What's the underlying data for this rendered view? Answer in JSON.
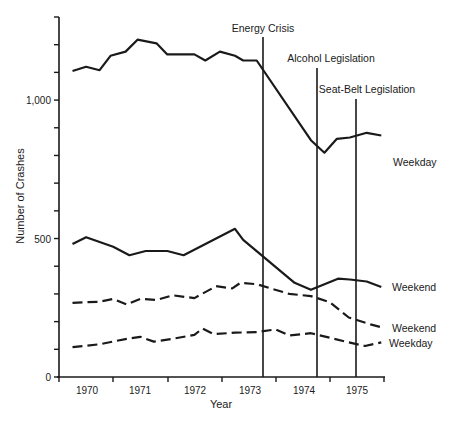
{
  "chart_data": {
    "type": "line",
    "title": "",
    "xlabel": "Year",
    "ylabel": "Number of Crashes",
    "ylim": [
      0,
      1300
    ],
    "yticks": [
      0,
      100,
      200,
      300,
      400,
      500,
      600,
      700,
      800,
      900,
      1000,
      1100,
      1200,
      1300
    ],
    "ytick_labels": [
      {
        "value": 0,
        "label": "0"
      },
      {
        "value": 500,
        "label": "500"
      },
      {
        "value": 1000,
        "label": "1,000"
      }
    ],
    "xlim": [
      1969.75,
      1975.75
    ],
    "xticks": [
      1969.75,
      1970.75,
      1971.75,
      1972.75,
      1973.75,
      1974.75,
      1975.75
    ],
    "x_category_labels": [
      {
        "x": 1970.25,
        "label": "1970"
      },
      {
        "x": 1971.25,
        "label": "1971"
      },
      {
        "x": 1972.25,
        "label": "1972"
      },
      {
        "x": 1973.25,
        "label": "1973"
      },
      {
        "x": 1974.25,
        "label": "1974"
      },
      {
        "x": 1975.25,
        "label": "1975"
      }
    ],
    "grid": false,
    "legend": "inline labels at right end of each line",
    "annotations": [
      {
        "label": "Energy Crisis",
        "x": 1973.4,
        "top_value": 1245
      },
      {
        "label": "Alcohol Legislation",
        "x": 1974.4,
        "top_value": 1120
      },
      {
        "label": "Seat-Belt Legislation",
        "x": 1975.1,
        "top_value": 1020
      }
    ],
    "series": [
      {
        "name": "Weekday",
        "style": "solid",
        "label": "Weekday",
        "x": [
          1970.0,
          1970.25,
          1970.5,
          1970.7,
          1970.98,
          1971.2,
          1971.55,
          1971.75,
          1972.25,
          1972.45,
          1972.72,
          1973.0,
          1973.15,
          1973.4,
          1974.4,
          1974.65,
          1974.88,
          1975.12,
          1975.43,
          1975.7
        ],
        "values": [
          1105,
          1120,
          1108,
          1160,
          1175,
          1218,
          1205,
          1165,
          1165,
          1143,
          1175,
          1160,
          1143,
          1143,
          855,
          810,
          860,
          865,
          882,
          872
        ]
      },
      {
        "name": "Weekend (solid)",
        "style": "solid",
        "label": "Weekend",
        "x": [
          1970.0,
          1970.25,
          1970.75,
          1971.05,
          1971.35,
          1971.75,
          1972.05,
          1973.0,
          1973.15,
          1974.1,
          1974.4,
          1974.9,
          1975.12,
          1975.43,
          1975.7
        ],
        "values": [
          480,
          505,
          470,
          440,
          455,
          455,
          440,
          535,
          495,
          340,
          315,
          355,
          352,
          345,
          325
        ]
      },
      {
        "name": "Weekend (dashed)",
        "style": "dashed",
        "label": "Weekend",
        "x": [
          1970.0,
          1970.5,
          1970.75,
          1971.0,
          1971.25,
          1971.55,
          1971.85,
          1972.25,
          1972.65,
          1972.95,
          1973.1,
          1973.4,
          1974.0,
          1974.4,
          1974.75,
          1975.1,
          1975.5,
          1975.7
        ],
        "values": [
          268,
          272,
          282,
          262,
          282,
          278,
          295,
          285,
          328,
          320,
          340,
          335,
          300,
          292,
          270,
          215,
          190,
          180
        ]
      },
      {
        "name": "Weekday (dashed)",
        "style": "dashed",
        "label": "Weekday",
        "x": [
          1970.0,
          1970.5,
          1971.0,
          1971.25,
          1971.5,
          1971.85,
          1972.25,
          1972.4,
          1972.6,
          1973.0,
          1973.4,
          1973.75,
          1974.0,
          1974.4,
          1974.75,
          1975.1,
          1975.4,
          1975.7
        ],
        "values": [
          108,
          118,
          138,
          145,
          128,
          138,
          152,
          175,
          155,
          160,
          162,
          172,
          150,
          158,
          142,
          125,
          112,
          125
        ]
      }
    ]
  },
  "labels": {
    "ylabel": "Number of Crashes",
    "xlabel": "Year",
    "y0": "0",
    "y500": "500",
    "y1000": "1,000",
    "years": [
      "1970",
      "1971",
      "1972",
      "1973",
      "1974",
      "1975"
    ],
    "energy": "Energy Crisis",
    "alcohol": "Alcohol Legislation",
    "seatbelt": "Seat-Belt Legislation",
    "weekday_solid": "Weekday",
    "weekend_solid": "Weekend",
    "weekend_dashed": "Weekend",
    "weekday_dashed": "Weekday"
  }
}
